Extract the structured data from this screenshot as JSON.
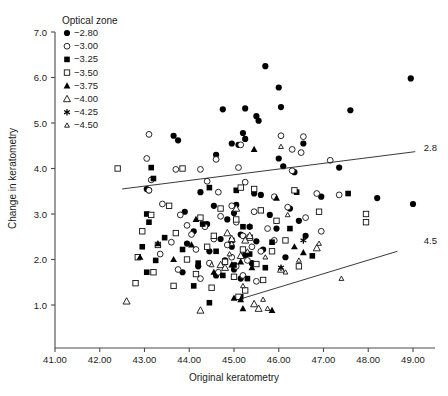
{
  "chart_data": {
    "type": "scatter",
    "title": "",
    "xlabel": "Original keratometry",
    "ylabel": "Change in keratometry",
    "xlim": [
      40.7,
      49.4
    ],
    "ylim": [
      0.55,
      7.0
    ],
    "xticks": [
      "41.00",
      "42.00",
      "43.00",
      "44.00",
      "45.00",
      "46.00",
      "47.00",
      "48.00",
      "49.00"
    ],
    "xtick_values": [
      41,
      42,
      43,
      44,
      45,
      46,
      47,
      48,
      49
    ],
    "yticks": [
      "1.0",
      "2.0",
      "3.0",
      "4.0",
      "5.0",
      "6.0",
      "7.0"
    ],
    "ytick_values": [
      1,
      2,
      3,
      4,
      5,
      6,
      7
    ],
    "grid": false,
    "legend_position": "top-left-inside",
    "legend": {
      "title": "Optical zone",
      "entries": [
        {
          "label": "−2.80",
          "marker": "filled-circle"
        },
        {
          "label": "−3.00",
          "marker": "open-circle"
        },
        {
          "label": "−3.25",
          "marker": "filled-square"
        },
        {
          "label": "−3.50",
          "marker": "open-square"
        },
        {
          "label": "−3.75",
          "marker": "filled-triangle"
        },
        {
          "label": "−4.00",
          "marker": "open-triangle"
        },
        {
          "label": "−4.25",
          "marker": "asterisk"
        },
        {
          "label": "−4.50",
          "marker": "small-open-triangle"
        }
      ]
    },
    "annotations": [
      {
        "text": "2.8",
        "x": 49.15,
        "y": 4.47
      },
      {
        "text": "4.5",
        "x": 49.15,
        "y": 2.42
      }
    ],
    "trendlines": [
      {
        "name": "2.8",
        "x0": 42.5,
        "y0": 3.55,
        "x1": 49.05,
        "y1": 4.37
      },
      {
        "name": "4.5",
        "x0": 45.2,
        "y0": 1.15,
        "x1": 48.65,
        "y1": 2.18
      }
    ],
    "series": [
      {
        "name": "−2.80",
        "marker": "filled-circle",
        "points": [
          [
            45.7,
            6.25
          ],
          [
            46.0,
            5.78
          ],
          [
            48.95,
            5.98
          ],
          [
            46.05,
            5.35
          ],
          [
            45.25,
            5.32
          ],
          [
            44.75,
            5.3
          ],
          [
            47.6,
            5.28
          ],
          [
            45.5,
            5.15
          ],
          [
            45.55,
            5.05
          ],
          [
            43.65,
            4.72
          ],
          [
            43.75,
            4.62
          ],
          [
            45.2,
            4.78
          ],
          [
            45.25,
            4.65
          ],
          [
            46.55,
            4.55
          ],
          [
            44.95,
            4.55
          ],
          [
            45.1,
            4.52
          ],
          [
            44.6,
            4.3
          ],
          [
            46.0,
            4.22
          ],
          [
            46.1,
            4.05
          ],
          [
            47.35,
            4.02
          ],
          [
            46.35,
            3.92
          ],
          [
            43.05,
            3.55
          ],
          [
            43.1,
            3.52
          ],
          [
            44.25,
            3.48
          ],
          [
            45.45,
            3.45
          ],
          [
            45.6,
            3.42
          ],
          [
            46.95,
            3.38
          ],
          [
            48.2,
            3.35
          ],
          [
            49.0,
            3.22
          ],
          [
            45.05,
            3.2
          ],
          [
            44.55,
            3.18
          ],
          [
            46.25,
            3.12
          ],
          [
            43.9,
            3.05
          ],
          [
            45.0,
            3.02
          ],
          [
            45.8,
            2.98
          ],
          [
            44.85,
            2.88
          ],
          [
            46.45,
            2.85
          ],
          [
            44.4,
            2.78
          ],
          [
            45.35,
            2.72
          ],
          [
            45.95,
            2.68
          ],
          [
            44.1,
            2.62
          ],
          [
            45.15,
            2.55
          ],
          [
            46.6,
            2.52
          ],
          [
            44.7,
            2.45
          ],
          [
            45.5,
            2.4
          ],
          [
            43.95,
            2.35
          ],
          [
            44.95,
            2.28
          ],
          [
            45.65,
            2.22
          ],
          [
            44.45,
            2.18
          ],
          [
            45.25,
            2.1
          ],
          [
            46.15,
            2.05
          ],
          [
            44.8,
            1.98
          ],
          [
            45.4,
            1.92
          ],
          [
            44.2,
            1.85
          ],
          [
            45.0,
            1.78
          ],
          [
            43.85,
            1.72
          ],
          [
            44.6,
            1.65
          ],
          [
            45.15,
            1.58
          ]
        ]
      },
      {
        "name": "−3.00",
        "marker": "open-circle",
        "points": [
          [
            43.1,
            4.75
          ],
          [
            46.05,
            4.72
          ],
          [
            46.55,
            4.7
          ],
          [
            46.3,
            4.42
          ],
          [
            45.15,
            4.52
          ],
          [
            46.5,
            4.35
          ],
          [
            43.05,
            4.22
          ],
          [
            44.6,
            4.2
          ],
          [
            47.15,
            4.18
          ],
          [
            45.1,
            4.02
          ],
          [
            43.7,
            3.98
          ],
          [
            44.25,
            3.98
          ],
          [
            46.3,
            3.95
          ],
          [
            43.15,
            3.75
          ],
          [
            44.4,
            3.72
          ],
          [
            45.25,
            3.7
          ],
          [
            43.1,
            3.52
          ],
          [
            44.65,
            3.48
          ],
          [
            46.85,
            3.45
          ],
          [
            47.35,
            3.42
          ],
          [
            45.9,
            3.38
          ],
          [
            43.4,
            3.22
          ],
          [
            44.95,
            3.18
          ],
          [
            46.2,
            3.15
          ],
          [
            45.45,
            3.05
          ],
          [
            43.8,
            2.98
          ],
          [
            44.7,
            2.95
          ],
          [
            46.6,
            2.92
          ],
          [
            45.05,
            2.82
          ],
          [
            43.95,
            2.75
          ],
          [
            44.35,
            2.72
          ],
          [
            45.75,
            2.68
          ],
          [
            46.95,
            2.62
          ],
          [
            44.05,
            2.55
          ],
          [
            45.2,
            2.52
          ],
          [
            44.55,
            2.45
          ],
          [
            45.9,
            2.42
          ],
          [
            43.6,
            2.38
          ],
          [
            44.85,
            2.32
          ],
          [
            45.4,
            2.28
          ],
          [
            44.15,
            2.22
          ],
          [
            45.6,
            2.18
          ],
          [
            43.35,
            2.12
          ],
          [
            44.95,
            2.05
          ],
          [
            45.3,
            1.98
          ],
          [
            44.45,
            1.92
          ],
          [
            45.05,
            1.85
          ],
          [
            43.75,
            1.78
          ],
          [
            44.65,
            1.72
          ],
          [
            45.2,
            1.65
          ],
          [
            44.25,
            1.58
          ],
          [
            45.5,
            1.52
          ]
        ]
      },
      {
        "name": "−3.25",
        "marker": "filled-square",
        "points": [
          [
            43.15,
            4.02
          ],
          [
            43.2,
            3.78
          ],
          [
            44.45,
            3.58
          ],
          [
            45.05,
            3.52
          ],
          [
            46.4,
            3.48
          ],
          [
            47.55,
            3.45
          ],
          [
            43.05,
            3.0
          ],
          [
            43.1,
            2.82
          ],
          [
            44.3,
            2.78
          ],
          [
            45.2,
            2.72
          ],
          [
            46.25,
            2.68
          ],
          [
            43.45,
            2.48
          ],
          [
            44.95,
            2.42
          ],
          [
            45.85,
            2.38
          ],
          [
            42.95,
            2.28
          ],
          [
            43.85,
            2.22
          ],
          [
            44.6,
            2.18
          ],
          [
            45.35,
            2.12
          ],
          [
            46.75,
            2.08
          ],
          [
            43.25,
            1.98
          ],
          [
            44.2,
            1.92
          ],
          [
            45.0,
            1.88
          ],
          [
            45.7,
            1.82
          ],
          [
            43.05,
            1.72
          ],
          [
            44.75,
            1.65
          ],
          [
            45.3,
            1.58
          ],
          [
            44.1,
            1.42
          ],
          [
            45.15,
            1.18
          ],
          [
            44.45,
            1.05
          ]
        ]
      },
      {
        "name": "−3.50",
        "marker": "open-square",
        "points": [
          [
            42.4,
            4.0
          ],
          [
            43.85,
            4.0
          ],
          [
            45.15,
            3.58
          ],
          [
            45.45,
            3.55
          ],
          [
            46.35,
            3.52
          ],
          [
            43.55,
            3.18
          ],
          [
            44.7,
            3.12
          ],
          [
            45.6,
            3.08
          ],
          [
            46.9,
            3.05
          ],
          [
            47.95,
            3.0
          ],
          [
            47.95,
            2.82
          ],
          [
            43.15,
            2.98
          ],
          [
            44.25,
            2.92
          ],
          [
            45.05,
            2.88
          ],
          [
            45.95,
            2.85
          ],
          [
            42.95,
            2.62
          ],
          [
            43.7,
            2.58
          ],
          [
            44.55,
            2.52
          ],
          [
            45.35,
            2.48
          ],
          [
            46.15,
            2.42
          ],
          [
            43.3,
            2.32
          ],
          [
            44.4,
            2.28
          ],
          [
            45.2,
            2.22
          ],
          [
            45.85,
            2.18
          ],
          [
            42.85,
            2.05
          ],
          [
            43.95,
            2.0
          ],
          [
            44.8,
            1.95
          ],
          [
            45.5,
            1.9
          ],
          [
            46.45,
            1.85
          ],
          [
            43.2,
            1.72
          ],
          [
            44.15,
            1.68
          ],
          [
            45.0,
            1.62
          ],
          [
            45.65,
            1.55
          ],
          [
            42.8,
            1.48
          ],
          [
            43.65,
            1.42
          ],
          [
            44.5,
            1.38
          ],
          [
            45.25,
            1.32
          ],
          [
            45.1,
            1.18
          ]
        ]
      },
      {
        "name": "−3.75",
        "marker": "filled-triangle",
        "points": [
          [
            45.45,
            4.42
          ],
          [
            45.95,
            3.35
          ],
          [
            44.15,
            2.88
          ],
          [
            43.3,
            2.35
          ],
          [
            44.05,
            2.32
          ],
          [
            46.35,
            2.28
          ],
          [
            46.55,
            2.15
          ],
          [
            42.9,
            2.05
          ],
          [
            43.65,
            2.0
          ],
          [
            45.15,
            1.95
          ],
          [
            44.95,
            1.88
          ],
          [
            45.4,
            1.82
          ],
          [
            44.55,
            1.72
          ],
          [
            45.0,
            1.15
          ],
          [
            45.15,
            1.12
          ],
          [
            45.2,
            0.92
          ],
          [
            45.85,
            0.88
          ]
        ]
      },
      {
        "name": "−4.00",
        "marker": "open-triangle",
        "points": [
          [
            45.05,
            3.12
          ],
          [
            44.85,
            2.58
          ],
          [
            45.35,
            2.52
          ],
          [
            44.95,
            2.45
          ],
          [
            45.25,
            2.42
          ],
          [
            46.85,
            2.25
          ],
          [
            45.15,
            2.08
          ],
          [
            44.7,
            1.88
          ],
          [
            44.8,
            1.82
          ],
          [
            46.05,
            1.78
          ],
          [
            42.6,
            1.08
          ],
          [
            44.25,
            0.88
          ],
          [
            45.45,
            1.02
          ],
          [
            45.55,
            0.92
          ]
        ]
      },
      {
        "name": "−4.25",
        "marker": "asterisk",
        "points": [
          [
            45.35,
            2.72
          ],
          [
            46.55,
            2.42
          ],
          [
            46.05,
            1.82
          ]
        ]
      },
      {
        "name": "−4.50",
        "marker": "small-open-triangle",
        "points": [
          [
            46.05,
            4.48
          ],
          [
            46.2,
            2.98
          ],
          [
            46.9,
            2.35
          ],
          [
            45.3,
            2.18
          ],
          [
            44.9,
            2.12
          ],
          [
            45.7,
            2.05
          ],
          [
            46.45,
            1.98
          ],
          [
            44.5,
            1.88
          ],
          [
            46.15,
            1.72
          ],
          [
            47.4,
            1.58
          ],
          [
            45.2,
            1.42
          ],
          [
            45.65,
            1.12
          ],
          [
            45.75,
            0.92
          ],
          [
            44.95,
            2.35
          ]
        ]
      }
    ]
  },
  "ghost_top": ""
}
